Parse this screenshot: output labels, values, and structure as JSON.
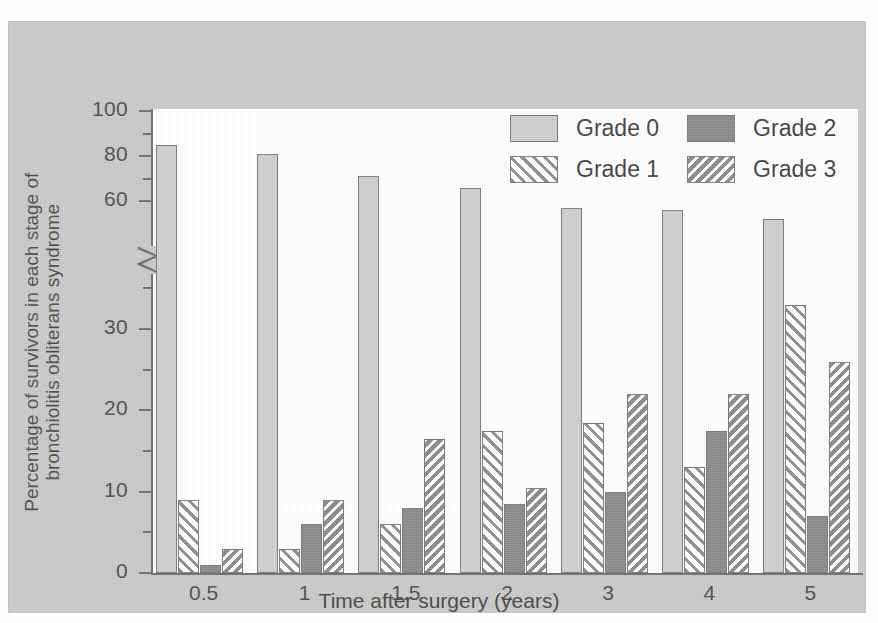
{
  "figure": {
    "background_color": "#c9c9c9",
    "plot_background_color": "#ffffff"
  },
  "legend": {
    "position": "top-right",
    "entries": [
      {
        "label": "Grade 0",
        "swatch": "solid-light-gray-swatch",
        "color": "#cfcfcf"
      },
      {
        "label": "Grade 2",
        "swatch": "solid-dark-gray-swatch",
        "color": "#8a8a8a"
      },
      {
        "label": "Grade 1",
        "swatch": "forward-hatch-swatch",
        "color": "#ffffff"
      },
      {
        "label": "Grade 3",
        "swatch": "back-hatch-swatch",
        "color": "#8a8a8a"
      }
    ]
  },
  "y_axis": {
    "title_line1": "Percentage of survivors in each stage of",
    "title_line2": "bronchiolitis obliterans syndrome",
    "labels": [
      "0",
      "10",
      "20",
      "30",
      "60",
      "80",
      "100"
    ],
    "minor_ticks": [
      5,
      15,
      25,
      35,
      70,
      90
    ],
    "break_between": [
      35,
      60
    ],
    "has_axis_break": true
  },
  "x_axis": {
    "title": "Time after surgery (years)",
    "labels": [
      "0.5",
      "1",
      "1.5",
      "2",
      "3",
      "4",
      "5"
    ]
  },
  "chart_data": {
    "type": "bar",
    "title": "",
    "xlabel": "Time after surgery (years)",
    "ylabel": "Percentage of survivors in each stage of bronchiolitis obliterans syndrome",
    "categories": [
      "0.5",
      "1",
      "1.5",
      "2",
      "3",
      "4",
      "5"
    ],
    "ylim": [
      0,
      100
    ],
    "ytick_labels": [
      "0",
      "10",
      "20",
      "30",
      "60",
      "80",
      "100"
    ],
    "axis_break": {
      "present": true,
      "low_end": 35,
      "high_start": 60
    },
    "grid": false,
    "legend_position": "top-right",
    "series": [
      {
        "name": "Grade 0",
        "fill": "solid-light-gray",
        "color": "#cfcfcf",
        "values": [
          85,
          81,
          71,
          66,
          57,
          56,
          52
        ]
      },
      {
        "name": "Grade 1",
        "fill": "forward-diagonal-hatch",
        "color": "#ffffff",
        "values": [
          9,
          3,
          6,
          17.5,
          18.5,
          13,
          33
        ]
      },
      {
        "name": "Grade 2",
        "fill": "solid-dark-gray",
        "color": "#8a8a8a",
        "values": [
          1,
          6,
          8,
          8.5,
          10,
          17.5,
          7
        ]
      },
      {
        "name": "Grade 3",
        "fill": "backward-diagonal-hatch",
        "color": "#8a8a8a",
        "values": [
          3,
          9,
          16.5,
          10.5,
          22,
          22,
          26
        ]
      }
    ]
  }
}
